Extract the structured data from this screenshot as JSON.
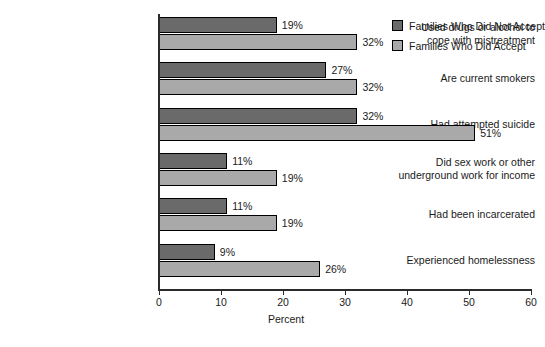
{
  "chart_data": {
    "type": "bar",
    "orientation": "horizontal",
    "title": "",
    "xlabel": "Percent",
    "ylabel": "",
    "xlim": [
      0,
      60
    ],
    "xticks": [
      0,
      10,
      20,
      30,
      40,
      50,
      60
    ],
    "grid": false,
    "legend_position": "top-right",
    "categories": [
      "Used drugs or alcohol to cope with mistreatment",
      "Are current smokers",
      "Had attempted suicide",
      "Did sex work or other underground work for income",
      "Had been incarcerated",
      "Experienced homelessness"
    ],
    "category_lines": [
      [
        "Used drugs or alcohol to",
        "cope with mistreatment"
      ],
      [
        "Are current smokers"
      ],
      [
        "Had attempted suicide"
      ],
      [
        "Did sex work or other",
        "underground work for income"
      ],
      [
        "Had been incarcerated"
      ],
      [
        "Experienced homelessness"
      ]
    ],
    "series": [
      {
        "name": "Families Who Did Not Accept",
        "color": "#6a6a6a",
        "values": [
          19,
          27,
          32,
          11,
          11,
          9
        ],
        "labels": [
          "19%",
          "27%",
          "32%",
          "11%",
          "11%",
          "9%"
        ]
      },
      {
        "name": "Families Who Did Accept",
        "color": "#a9a9a9",
        "values": [
          32,
          32,
          51,
          19,
          19,
          26
        ],
        "labels": [
          "32%",
          "32%",
          "51%",
          "19%",
          "19%",
          "26%"
        ]
      }
    ]
  },
  "axis": {
    "tick_labels": [
      "0",
      "10",
      "20",
      "30",
      "40",
      "50",
      "60"
    ],
    "title": "Percent"
  },
  "legend": {
    "items": [
      {
        "label": "Families Who Did Not Accept",
        "color": "#6a6a6a"
      },
      {
        "label": "Families Who Did Accept",
        "color": "#a9a9a9"
      }
    ]
  }
}
